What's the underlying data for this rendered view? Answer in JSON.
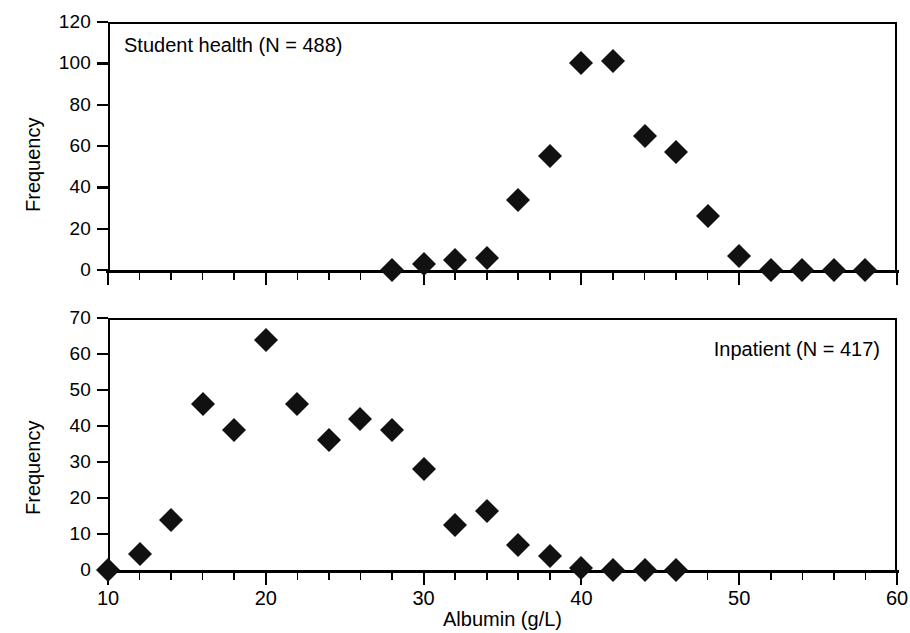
{
  "figure": {
    "xlabel": "Albumin (g/L)",
    "ylabel_top": "Frequency",
    "ylabel_bottom": "Frequency",
    "marker_color": "#111111",
    "axis_color": "#000000",
    "background": "#ffffff"
  },
  "panels": {
    "top": {
      "note": "Student health (N = 488)",
      "note_align": "left"
    },
    "bottom": {
      "note": "Inpatient (N = 417)",
      "note_align": "right"
    }
  },
  "chart_data": [
    {
      "type": "scatter",
      "title": "Student health (N = 488)",
      "xlabel": "Albumin (g/L)",
      "ylabel": "Frequency",
      "xlim": [
        10,
        60
      ],
      "ylim": [
        0,
        120
      ],
      "xticks": [
        10,
        20,
        30,
        40,
        50,
        60
      ],
      "xticks_minor_step": 2,
      "yticks": [
        0,
        20,
        40,
        60,
        80,
        100,
        120
      ],
      "grid": false,
      "legend": "none",
      "marker": "filled-diamond",
      "x": [
        28,
        30,
        32,
        34,
        36,
        38,
        40,
        42,
        44,
        46,
        48,
        50,
        52,
        54,
        56,
        58
      ],
      "y": [
        0,
        3,
        5,
        6,
        34,
        55,
        100,
        101,
        65,
        57,
        26,
        7,
        0,
        0,
        0,
        0
      ]
    },
    {
      "type": "scatter",
      "title": "Inpatient (N = 417)",
      "xlabel": "Albumin (g/L)",
      "ylabel": "Frequency",
      "xlim": [
        10,
        60
      ],
      "ylim": [
        0,
        70
      ],
      "xticks": [
        10,
        20,
        30,
        40,
        50,
        60
      ],
      "xticks_minor_step": 2,
      "yticks": [
        0,
        10,
        20,
        30,
        40,
        50,
        60,
        70
      ],
      "grid": false,
      "legend": "none",
      "marker": "filled-diamond",
      "x": [
        10,
        12,
        14,
        16,
        18,
        20,
        22,
        24,
        26,
        28,
        30,
        32,
        34,
        36,
        38,
        40,
        42,
        44,
        46
      ],
      "y": [
        0,
        4.5,
        14,
        46,
        39,
        64,
        46,
        36,
        42,
        39,
        28,
        12.5,
        16.5,
        7,
        4,
        0.5,
        0,
        0,
        0
      ]
    }
  ]
}
